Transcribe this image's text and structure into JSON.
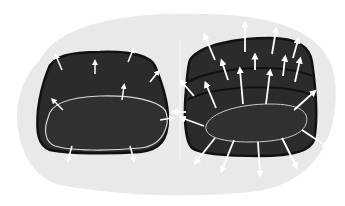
{
  "illustration": {
    "description": "Two dark cushion-shaped objects on a light gray blob background with white arrows radiating outward",
    "colors": {
      "background": "#ffffff",
      "blob": "#e9e9e9",
      "object_fill": "#2b2b2b",
      "object_outline": "#111111",
      "highlight": "#d8d8d8",
      "arrows": "#ffffff"
    },
    "left_object": {
      "label": "single cushion",
      "arrow_count": 9
    },
    "right_object": {
      "label": "stacked cushions",
      "arrow_count": 20
    }
  }
}
